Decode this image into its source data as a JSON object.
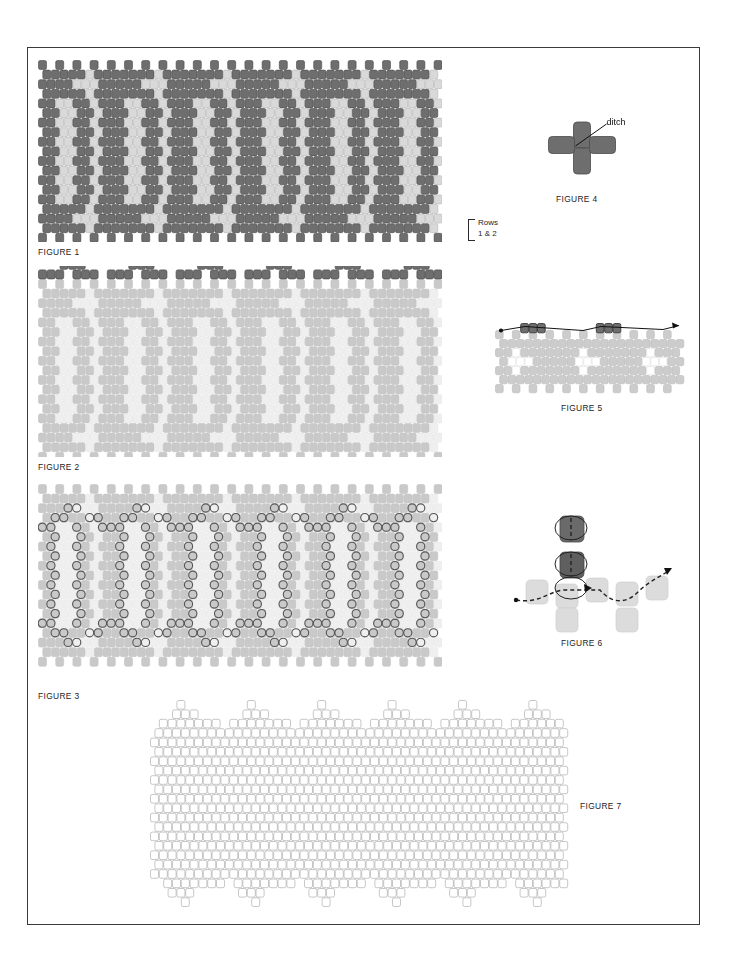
{
  "document": {
    "title": "Brick Stitch Beadwork Pattern Instructions",
    "page_background": "#ffffff",
    "border_color": "#3a3a3a"
  },
  "palette": {
    "bead_dark": "#6e6e6e",
    "bead_dark_stroke": "#4a4a4a",
    "bead_light": "#d9d9d9",
    "bead_light_stroke": "#b5b5b5",
    "bead_white": "#ffffff",
    "bead_outline_only": "#9a9a9a",
    "faded_dark": "#c9c9c9",
    "faded_light": "#efefef",
    "faded_white": "#ffffff",
    "thread": "#1a1a1a",
    "ring_stroke": "#555555",
    "label_text": "#1d1d1d"
  },
  "figures": [
    {
      "id": "fig1",
      "label": "FIGURE 1",
      "kind": "bead-chart",
      "style": "full-color",
      "width": 404,
      "height": 182,
      "cols": 47,
      "rows": 19,
      "bead_w": 8.6,
      "bead_h": 9.6,
      "description": "Full-contrast brick-stitch chart, dark background with light vertical panels and light plus-shaped motifs.",
      "annotation": {
        "text": "Rows\n1 & 2",
        "bracket": true,
        "points_to": "bottom-right two rows"
      }
    },
    {
      "id": "fig2",
      "label": "FIGURE 2",
      "kind": "bead-chart",
      "style": "faded-with-top-accent",
      "width": 404,
      "height": 191,
      "cols": 47,
      "rows": 19,
      "bead_w": 8.6,
      "bead_h": 9.6,
      "description": "Same chart faded to light gray, with the first two rows of dark beads drawn in full contrast across the top as peaked clusters.",
      "accent_rows": 2
    },
    {
      "id": "fig3",
      "label": "FIGURE 3",
      "kind": "bead-chart",
      "style": "faded-with-rings",
      "width": 404,
      "height": 206,
      "cols": 47,
      "rows": 19,
      "bead_w": 8.6,
      "bead_h": 9.6,
      "description": "Same faded chart overlaid with outlined circles marking the thread path around the light vertical panels and along the zig-zag upper and lower borders.",
      "ring_diameter": 8.5
    },
    {
      "id": "fig7",
      "label": "FIGURE 7",
      "kind": "bead-chart",
      "style": "blank-grid",
      "width": 420,
      "height": 215,
      "cols": 47,
      "rows": 22,
      "bead_w": 8.8,
      "bead_h": 9.4,
      "description": "Blank outline-only bead grid of the same silhouette, provided for colouring in your own design."
    },
    {
      "id": "fig4",
      "label": "FIGURE 4",
      "kind": "detail-ditch",
      "width": 110,
      "height": 72,
      "description": "Four beads forming a plus shape; a leader line points to the junction between two side-by-side beads.",
      "callout": "ditch"
    },
    {
      "id": "fig5",
      "label": "FIGURE  5",
      "kind": "detail-thread-row",
      "width": 190,
      "height": 82,
      "description": "Light-gray band of beadwork with two groups of three dark beads being added along the top edge; a thread line with arrowheads runs left to right.",
      "dark_group_size": 3,
      "dark_groups": 2
    },
    {
      "id": "fig6",
      "label": "FIGURE 6",
      "kind": "detail-thread-path",
      "width": 175,
      "height": 125,
      "description": "Stitch detail: two dark beads stacked vertically with looping thread, seated on a row of light beads; dashed thread path travels left to right with arrowheads.",
      "dark_beads": 2
    }
  ],
  "chart_data": {
    "type": "heatmap",
    "legend": [
      {
        "name": "dark bead",
        "color": "#6e6e6e"
      },
      {
        "name": "light bead",
        "color": "#d9d9d9"
      }
    ],
    "grid": {
      "cols": 47,
      "rows": 19,
      "offset": "half-bead alternating rows"
    },
    "motif_repeat_cols": 8,
    "motifs": [
      "vertical light panel 2 beads wide, 11 rows tall",
      "light plus/cross of 5 beads at top and bottom borders",
      "scalloped dark top and bottom edges"
    ]
  }
}
